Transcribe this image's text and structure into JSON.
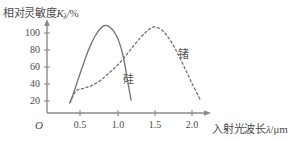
{
  "figure": {
    "background_color": "#ffffff",
    "axis_color": "#8a8a8a",
    "curve_color": "#707070",
    "text_color": "#4a4a4a"
  },
  "axes": {
    "y_title_prefix": "相对灵敏度",
    "y_title_symbol": "K",
    "y_title_subscript": "λ",
    "y_title_suffix": "/%",
    "x_title_prefix": "入射光波长",
    "x_title_symbol": "λ",
    "x_title_suffix": "/μm",
    "origin_label": "O",
    "y_ticks": [
      "100",
      "80",
      "60",
      "40",
      "20"
    ],
    "x_ticks": [
      "0.5",
      "1.0",
      "1.5",
      "2.0"
    ]
  },
  "annotations": {
    "silicon_label": "硅",
    "germanium_label": "锗"
  },
  "chart_data": {
    "type": "line",
    "title": "",
    "xlabel": "入射光波长λ/μm",
    "ylabel": "相对灵敏度Kλ/%",
    "xlim": [
      0,
      2.3
    ],
    "ylim": [
      0,
      110
    ],
    "xticks": [
      0.5,
      1.0,
      1.5,
      2.0
    ],
    "yticks": [
      20,
      40,
      60,
      80,
      100
    ],
    "grid": false,
    "legend": "inline-annotations",
    "series": [
      {
        "name": "硅",
        "style": "solid",
        "color": "#707070",
        "peak_x": 0.84,
        "peak_y": 103,
        "x": [
          0.37,
          0.42,
          0.48,
          0.55,
          0.62,
          0.7,
          0.78,
          0.84,
          0.9,
          0.96,
          1.02,
          1.08,
          1.13,
          1.18
        ],
        "y": [
          12,
          24,
          40,
          58,
          75,
          90,
          100,
          103,
          101,
          95,
          84,
          65,
          40,
          15
        ]
      },
      {
        "name": "锗",
        "style": "dashed",
        "color": "#707070",
        "peak_x": 1.47,
        "peak_y": 101,
        "x": [
          0.37,
          0.45,
          0.55,
          0.65,
          0.75,
          0.85,
          0.95,
          1.05,
          1.15,
          1.25,
          1.35,
          1.47,
          1.58,
          1.68,
          1.78,
          1.88,
          1.98,
          2.1
        ],
        "y": [
          12,
          26,
          29,
          32,
          37,
          44,
          52,
          61,
          72,
          83,
          93,
          101,
          98,
          88,
          73,
          55,
          36,
          15
        ]
      }
    ]
  }
}
